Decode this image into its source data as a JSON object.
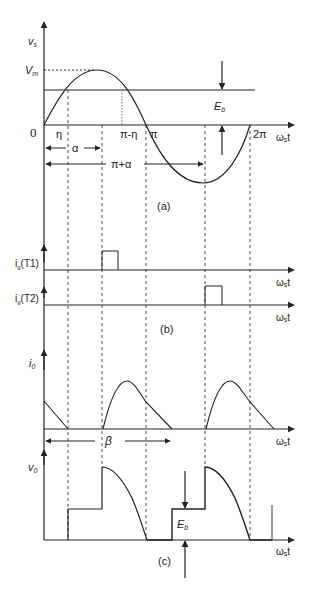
{
  "figure": {
    "panel_a": {
      "caption": "(a)",
      "y_label": "v",
      "y_label_sub": "s",
      "x_label": "ω",
      "x_label_sub": "s",
      "x_label_tail": "t",
      "origin_label": "0",
      "peak_label": "V",
      "peak_label_sub": "m",
      "eb_label": "E",
      "eb_label_sub": "b",
      "tick_labels": {
        "eta": "η",
        "pi_minus_eta": "π-η",
        "pi": "π",
        "two_pi": "2π"
      },
      "interval_labels": {
        "alpha": "α",
        "pi_plus_alpha": "π+α"
      }
    },
    "panel_b": {
      "caption": "(b)",
      "t1_label": "i",
      "t1_label_sub": "g",
      "t1_label_tail": "(T1)",
      "t2_label": "i",
      "t2_label_sub": "g",
      "t2_label_tail": "(T2)",
      "x_label": "ω",
      "x_label_sub": "s",
      "x_label_tail": "t"
    },
    "panel_io": {
      "y_label": "i",
      "y_label_sub": "0",
      "x_label": "ω",
      "x_label_sub": "s",
      "x_label_tail": "t",
      "beta_label": "β"
    },
    "panel_c": {
      "caption": "(c)",
      "y_label": "v",
      "y_label_sub": "0",
      "x_label": "ω",
      "x_label_sub": "s",
      "x_label_tail": "t",
      "eb_label": "E",
      "eb_label_sub": "b"
    }
  },
  "colors": {
    "line": "#222222",
    "background": "#ffffff"
  }
}
